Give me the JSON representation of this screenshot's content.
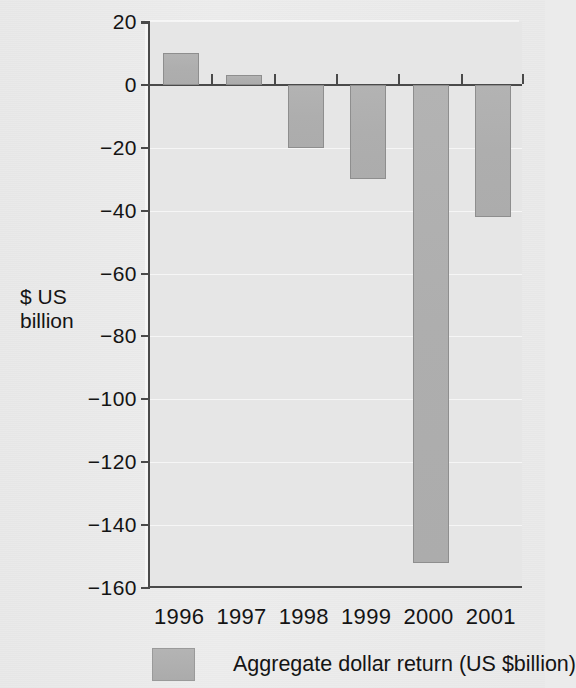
{
  "chart_data": {
    "type": "bar",
    "title": "",
    "subtitle": "",
    "xlabel": "",
    "ylabel": "$ US\nbillion",
    "categories": [
      "1996",
      "1997",
      "1998",
      "1999",
      "2000",
      "2001"
    ],
    "values": [
      10,
      3,
      -20,
      -30,
      -152,
      -42
    ],
    "series": [
      {
        "name": "Aggregate dollar return (US $billion)",
        "values": [
          10,
          3,
          -20,
          -30,
          -152,
          -42
        ]
      }
    ],
    "ylim": [
      -160,
      20
    ],
    "ytick_labels": [
      "20",
      "0",
      "−20",
      "−40",
      "−60",
      "−80",
      "−100",
      "−120",
      "−140",
      "−160"
    ],
    "ytick_values": [
      20,
      0,
      -20,
      -40,
      -60,
      -80,
      -100,
      -120,
      -140,
      -160
    ],
    "grid": true,
    "legend_position": "bottom",
    "legend_entries": [
      "Aggregate dollar return (US $billion)"
    ],
    "bar_color": "#aeaeae",
    "axis_color": "#4a4a4a",
    "background_color": "#e6e6e6",
    "annotations": []
  },
  "legend": {
    "label": "Aggregate dollar return (US $billion)",
    "swatch_name": "bar-color-swatch"
  }
}
